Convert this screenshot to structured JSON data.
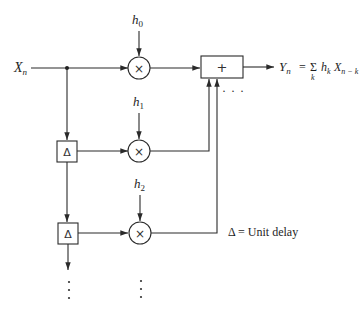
{
  "diagram": {
    "type": "block-diagram",
    "input": {
      "label": "X",
      "subscript": "n"
    },
    "output": {
      "label": "Y",
      "subscript": "n",
      "equation_eq": "=",
      "sum_symbol": "Σ",
      "sum_index": "k",
      "term_coef": "h",
      "term_coef_sub": "k",
      "term_var": "X",
      "term_var_sub": "n − k"
    },
    "adder": {
      "symbol": "+"
    },
    "multipliers": [
      {
        "symbol": "×",
        "coef": "h",
        "coef_sub": "0"
      },
      {
        "symbol": "×",
        "coef": "h",
        "coef_sub": "1"
      },
      {
        "symbol": "×",
        "coef": "h",
        "coef_sub": "2"
      }
    ],
    "delays": [
      {
        "symbol": "Δ"
      },
      {
        "symbol": "Δ"
      }
    ],
    "continuation": "· · ·",
    "legend": {
      "text": "Δ = Unit delay"
    },
    "colors": {
      "line": "#2a2a2a",
      "background": "#ffffff"
    }
  }
}
